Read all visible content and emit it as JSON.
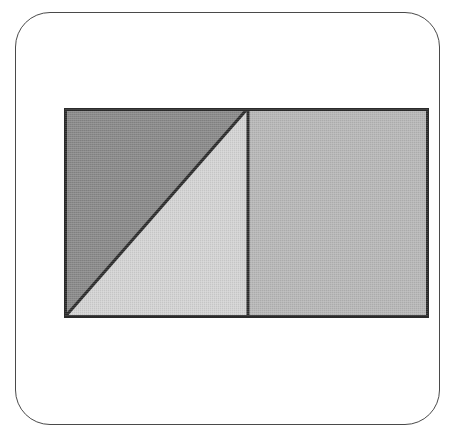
{
  "canvas": {
    "width": 460,
    "height": 439,
    "background_color": "#ffffff"
  },
  "card": {
    "label": "rounded-rectangle-card",
    "border_color": "#4a4a4a",
    "fill_color": "#ffffff",
    "corner_radius": 35,
    "x": 15,
    "y": 12,
    "width": 425,
    "height": 413
  },
  "figure": {
    "title": "",
    "caption": "",
    "type": "geometry-diagram",
    "outline_color": "#2b2b2b",
    "outline_width": 3,
    "bounds": {
      "x": 48,
      "y": 95,
      "width": 365,
      "height": 210
    },
    "regions": [
      {
        "name": "upper-left-dark-triangle",
        "shape": "triangle",
        "fill_color": "#8a8a8a",
        "vertices": [
          [
            0,
            0
          ],
          [
            184,
            0
          ],
          [
            0,
            210
          ]
        ]
      },
      {
        "name": "lower-right-light-triangle",
        "shape": "triangle",
        "fill_color": "#d4d4d4",
        "vertices": [
          [
            184,
            0
          ],
          [
            184,
            210
          ],
          [
            0,
            210
          ]
        ]
      },
      {
        "name": "right-medium-rectangle",
        "shape": "rectangle",
        "fill_color": "#b8b8b8",
        "vertices": [
          [
            184,
            0
          ],
          [
            365,
            0
          ],
          [
            365,
            210
          ],
          [
            184,
            210
          ]
        ]
      }
    ],
    "lines": [
      {
        "name": "vertical-divider",
        "from": [
          184,
          0
        ],
        "to": [
          184,
          210
        ],
        "color": "#2b2b2b",
        "width": 3
      },
      {
        "name": "diagonal-divider",
        "from": [
          184,
          0
        ],
        "to": [
          0,
          210
        ],
        "color": "#2b2b2b",
        "width": 3
      }
    ]
  }
}
